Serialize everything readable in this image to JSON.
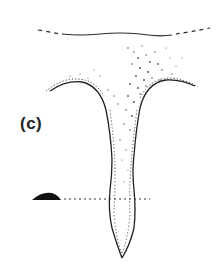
{
  "figure": {
    "panel_label": "(c)",
    "colors": {
      "line": "#2a2a2a",
      "stipple": "#555555",
      "blob": "#111111",
      "background": "#ffffff"
    },
    "elements": [
      "top-surface-line",
      "funnel-conduit-outline",
      "stippled-fill",
      "black-lens-blob",
      "dotted-horizontal-line"
    ]
  }
}
